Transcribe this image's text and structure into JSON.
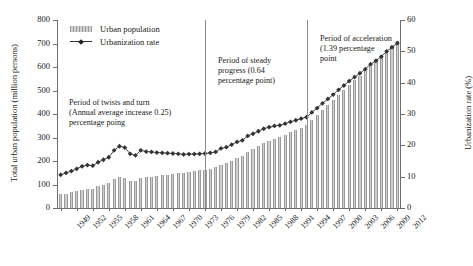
{
  "chart_data": {
    "type": "bar",
    "title": "",
    "xlabel": "",
    "ylabel": "Total urban population (million persons)",
    "y2label": "Urbanization rate (%)",
    "ylim": [
      0,
      800
    ],
    "y2lim": [
      0,
      60
    ],
    "yticks": [
      0,
      100,
      200,
      300,
      400,
      500,
      600,
      700,
      800
    ],
    "y2ticks": [
      0,
      10,
      20,
      30,
      40,
      50,
      60
    ],
    "grid": false,
    "legend_position": "top-left",
    "x": [
      1949,
      1950,
      1951,
      1952,
      1953,
      1954,
      1955,
      1956,
      1957,
      1958,
      1959,
      1960,
      1961,
      1962,
      1963,
      1964,
      1965,
      1966,
      1967,
      1968,
      1969,
      1970,
      1971,
      1972,
      1973,
      1974,
      1975,
      1976,
      1977,
      1978,
      1979,
      1980,
      1981,
      1982,
      1983,
      1984,
      1985,
      1986,
      1987,
      1988,
      1989,
      1990,
      1991,
      1992,
      1993,
      1994,
      1995,
      1996,
      1997,
      1998,
      1999,
      2000,
      2001,
      2002,
      2003,
      2004,
      2005,
      2006,
      2007,
      2008,
      2009,
      2010,
      2011,
      2012
    ],
    "xtick_labels": [
      1949,
      1952,
      1955,
      1958,
      1961,
      1964,
      1967,
      1970,
      1973,
      1976,
      1979,
      1982,
      1985,
      1988,
      1991,
      1994,
      1997,
      2000,
      2003,
      2006,
      2009,
      2012
    ],
    "series": [
      {
        "name": "Urban population",
        "type": "bar",
        "axis": "left",
        "unit": "million persons",
        "color": "#cfcfcf",
        "values": [
          57.6,
          61.7,
          66.3,
          71.6,
          78.3,
          82.5,
          82.9,
          91.9,
          99.5,
          107.2,
          123.7,
          130.7,
          127.1,
          116.6,
          116.5,
          129.5,
          130.5,
          133.1,
          135.5,
          138.4,
          141.2,
          144.2,
          147.1,
          149.4,
          153.5,
          155.9,
          160.3,
          163.4,
          166.7,
          172.5,
          185.0,
          191.4,
          201.7,
          214.8,
          222.7,
          240.2,
          250.9,
          263.7,
          276.7,
          286.6,
          295.4,
          302.0,
          312.0,
          323.7,
          333.5,
          341.7,
          351.7,
          373.0,
          394.5,
          416.1,
          437.5,
          459.1,
          480.6,
          502.1,
          523.8,
          542.8,
          562.1,
          582.9,
          606.3,
          624.0,
          645.1,
          669.8,
          690.8,
          711.8
        ]
      },
      {
        "name": "Urbanization rate",
        "type": "line",
        "axis": "right",
        "unit": "%",
        "color": "#333333",
        "values": [
          10.6,
          11.2,
          11.8,
          12.5,
          13.3,
          13.7,
          13.5,
          14.6,
          15.4,
          16.2,
          18.4,
          19.7,
          19.3,
          17.3,
          16.8,
          18.4,
          18.0,
          17.9,
          17.7,
          17.6,
          17.5,
          17.4,
          17.3,
          17.1,
          17.2,
          17.2,
          17.3,
          17.4,
          17.6,
          17.9,
          19.0,
          19.4,
          20.2,
          21.1,
          21.6,
          23.0,
          23.7,
          24.5,
          25.3,
          25.8,
          26.2,
          26.4,
          26.9,
          27.5,
          28.0,
          28.5,
          29.0,
          30.5,
          31.9,
          33.4,
          34.8,
          36.2,
          37.7,
          39.1,
          40.5,
          41.8,
          43.0,
          44.3,
          45.9,
          47.0,
          48.3,
          50.0,
          51.3,
          52.6
        ]
      }
    ],
    "annotations": [
      {
        "id": "period-1",
        "text": "Period of twists and turn (Annual average increase 0.25) percentage poing",
        "lines": [
          "Period of twists and turn",
          "(Annual average increase 0.25)",
          "percentage poing"
        ]
      },
      {
        "id": "period-2",
        "text": "Period of steady progress (0.64 percentage point)",
        "lines": [
          "Period of steady",
          "progress (0.64",
          "percentage point)"
        ]
      },
      {
        "id": "period-3",
        "text": "Period of acceleration (1.39 percentage point",
        "lines": [
          "Period of acceleration",
          "(1.39 percentage",
          "point"
        ]
      }
    ],
    "dividers": [
      {
        "id": "divider-1",
        "at_year": 1976
      },
      {
        "id": "divider-2",
        "at_year": 1995
      }
    ]
  },
  "legend": {
    "items": [
      {
        "label": "Urban population",
        "marker": "bar-swatch"
      },
      {
        "label": "Urbanization rate",
        "marker": "line-marker"
      }
    ]
  }
}
